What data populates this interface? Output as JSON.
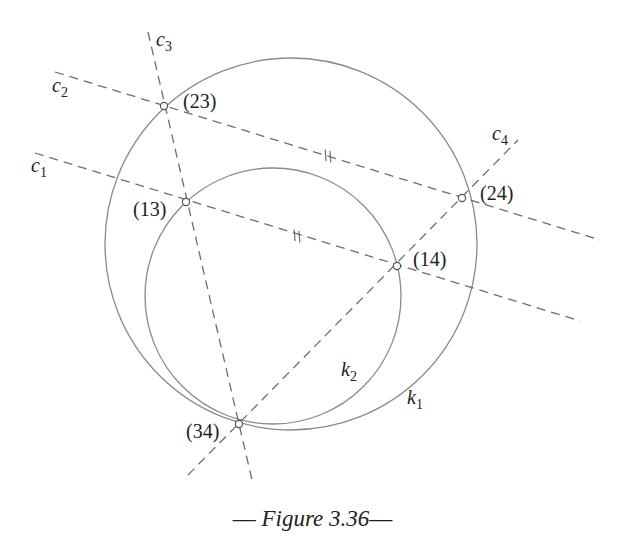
{
  "figure": {
    "caption_dash_left": "—",
    "caption_text": "Figure 3.36",
    "caption_dash_right": "—"
  },
  "diagram": {
    "circles": [
      {
        "id": "k1",
        "name": "k",
        "sub": "1",
        "cx": 291,
        "cy": 244,
        "r": 186,
        "label_x": 407,
        "label_y": 404
      },
      {
        "id": "k2",
        "name": "k",
        "sub": "2",
        "cx": 273,
        "cy": 296,
        "r": 128,
        "label_x": 341,
        "label_y": 376
      }
    ],
    "lines": [
      {
        "id": "c1",
        "name": "c",
        "sub": "1",
        "x1": 35,
        "y1": 153,
        "x2": 580,
        "y2": 321,
        "label_x": 31,
        "label_y": 172
      },
      {
        "id": "c2",
        "name": "c",
        "sub": "2",
        "x1": 55,
        "y1": 72,
        "x2": 600,
        "y2": 240,
        "label_x": 52,
        "label_y": 92
      },
      {
        "id": "c3",
        "name": "c",
        "sub": "3",
        "x1": 148,
        "y1": 32,
        "x2": 252,
        "y2": 480,
        "label_x": 156,
        "label_y": 46
      },
      {
        "id": "c4",
        "name": "c",
        "sub": "4",
        "x1": 188,
        "y1": 475,
        "x2": 518,
        "y2": 140,
        "label_x": 492,
        "label_y": 140
      }
    ],
    "points": [
      {
        "label": "(23)",
        "x": 164,
        "y": 106,
        "label_x": 183,
        "label_y": 108
      },
      {
        "label": "(13)",
        "x": 186,
        "y": 202,
        "label_x": 133,
        "label_y": 216
      },
      {
        "label": "(24)",
        "x": 462,
        "y": 198,
        "label_x": 480,
        "label_y": 200
      },
      {
        "label": "(14)",
        "x": 397,
        "y": 266,
        "label_x": 413,
        "label_y": 266
      },
      {
        "label": "(34)",
        "x": 239,
        "y": 424,
        "label_x": 186,
        "label_y": 438
      }
    ],
    "equal_marks": [
      {
        "on": "c2",
        "x": 328,
        "y": 156
      },
      {
        "on": "c1",
        "x": 297,
        "y": 236
      }
    ]
  }
}
